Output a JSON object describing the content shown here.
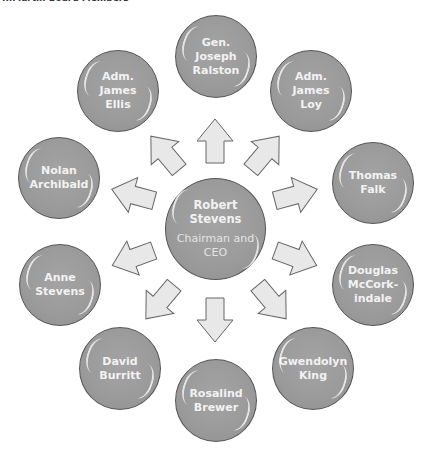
{
  "caption": "...Martin Board Members",
  "colors": {
    "node_fill": "#9a9a9a",
    "node_border": "#555555",
    "arrow_fill": "#e8e8e8",
    "arrow_stroke": "#666666",
    "text": "#f2f2f2"
  },
  "center": {
    "name": "Robert Stevens",
    "name_line1": "Robert",
    "name_line2": "Stevens",
    "role": "Chairman and CEO"
  },
  "members": [
    {
      "lines": [
        "Gen.",
        "Joseph",
        "Ralston"
      ]
    },
    {
      "lines": [
        "Adm.",
        "James",
        "Loy"
      ]
    },
    {
      "lines": [
        "Thomas",
        "Falk"
      ]
    },
    {
      "lines": [
        "Douglas",
        "McCork-",
        "indale"
      ]
    },
    {
      "lines": [
        "Gwendolyn",
        "King"
      ]
    },
    {
      "lines": [
        "Rosalind",
        "Brewer"
      ]
    },
    {
      "lines": [
        "David",
        "Burritt"
      ]
    },
    {
      "lines": [
        "Anne",
        "Stevens"
      ]
    },
    {
      "lines": [
        "Nolan",
        "Archibald"
      ]
    },
    {
      "lines": [
        "Adm.",
        "James",
        "Ellis"
      ]
    }
  ]
}
